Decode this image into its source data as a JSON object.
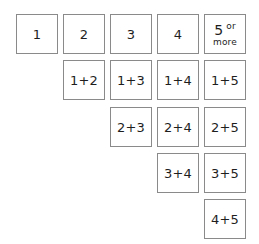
{
  "diagram": {
    "header_row": [
      {
        "label": "1"
      },
      {
        "label": "2"
      },
      {
        "label": "3"
      },
      {
        "label": "4"
      },
      {
        "label": "5",
        "superscript": "or",
        "sublabel": "more"
      }
    ],
    "rows": [
      [
        "",
        "1+2",
        "1+3",
        "1+4",
        "1+5"
      ],
      [
        "",
        "",
        "2+3",
        "2+4",
        "2+5"
      ],
      [
        "",
        "",
        "",
        "3+4",
        "3+5"
      ],
      [
        "",
        "",
        "",
        "",
        "4+5"
      ]
    ],
    "colors": {
      "border": "#8a8a8a",
      "text": "#1e1e1e",
      "background": "#ffffff"
    }
  }
}
